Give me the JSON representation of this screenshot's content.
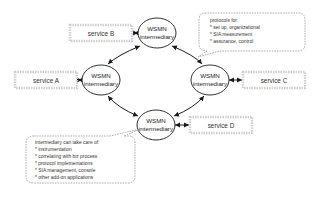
{
  "diagram": {
    "nodes": [
      {
        "id": "top",
        "line1": "WSMN",
        "line2": "intermediary"
      },
      {
        "id": "left",
        "line1": "WSMN",
        "line2": "intermediary"
      },
      {
        "id": "right",
        "line1": "WSMN",
        "line2": "intermediary"
      },
      {
        "id": "bottom",
        "line1": "WSMN",
        "line2": "intermediary"
      }
    ],
    "services": [
      {
        "id": "B",
        "label": "service B"
      },
      {
        "id": "A",
        "label": "service A"
      },
      {
        "id": "C",
        "label": "service C"
      },
      {
        "id": "D",
        "label": "service D"
      }
    ],
    "callout_protocols": {
      "title": "protocols for:",
      "items": [
        "* set up, organizational",
        "* SIA measurement",
        "* assurance, control"
      ]
    },
    "callout_intermediary": {
      "title": "intermediary can take care of:",
      "items": [
        "* instrumentation",
        "* correlating with biz process",
        "* protocol implementations",
        "* SIA management, console",
        "* other add-on applications"
      ]
    },
    "colors": {
      "line": "#1a1a1a",
      "service_border": "#c8c8c8",
      "callout_border": "#777777"
    }
  }
}
